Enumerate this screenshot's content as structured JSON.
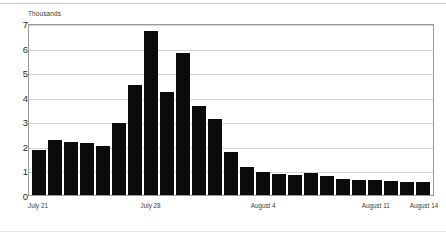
{
  "chart_data": {
    "type": "bar",
    "title": "",
    "subtitle": "",
    "unit_label": "Thousands",
    "xlabel": "",
    "ylabel": "",
    "ylim": [
      0,
      7
    ],
    "yticks": [
      7,
      6,
      5,
      4,
      3,
      2,
      1,
      0
    ],
    "grid": true,
    "legend": false,
    "bar_color": "#0b0b0b",
    "grid_color": "#d2d2d2",
    "axis_color": "#9a9a9a",
    "categories": [
      "July 21",
      "July 22",
      "July 23",
      "July 24",
      "July 25",
      "July 26",
      "July 27",
      "July 28",
      "July 29",
      "July 30",
      "July 31",
      "August 1",
      "August 2",
      "August 3",
      "August 4",
      "August 5",
      "August 6",
      "August 7",
      "August 8",
      "August 9",
      "August 10",
      "August 11",
      "August 12",
      "August 13",
      "August 14"
    ],
    "values": [
      1.85,
      2.22,
      2.17,
      2.12,
      1.98,
      2.93,
      4.47,
      6.68,
      4.18,
      5.78,
      3.62,
      3.1,
      1.75,
      1.15,
      0.92,
      0.85,
      0.82,
      0.88,
      0.76,
      0.66,
      0.63,
      0.6,
      0.57,
      0.53,
      0.52
    ],
    "xtick_labels": [
      "July 21",
      "July 28",
      "August 4",
      "August 11",
      "August 14"
    ],
    "xtick_indices": [
      0,
      7,
      14,
      21,
      24
    ]
  }
}
